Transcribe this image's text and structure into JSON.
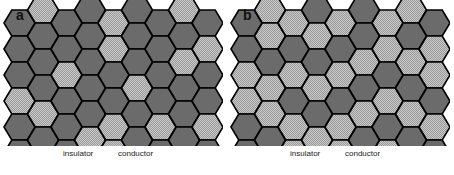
{
  "figure": {
    "width": 454,
    "height": 175,
    "background": "#ffffff",
    "type": "hexagonal-lattice-percolation-diagram"
  },
  "colors": {
    "insulator_fill": "#6b6b6b",
    "conductor_fill": "#9a9a9a",
    "conductor_dither": "#c9c9c9",
    "outline": "#000000",
    "label_text": "#1a1a1a",
    "panel_label_text": "#111111",
    "background": "#ffffff"
  },
  "geometry": {
    "hex_width": 31,
    "hex_height": 26,
    "hex_side": 10.5,
    "col_step": 23.5,
    "row_step": 26,
    "columns": 9,
    "rows": 6,
    "origin_x": 4,
    "origin_y": 10
  },
  "legend": {
    "insulator_label": "insulator",
    "conductor_label": "conductor",
    "insulator_label_x": 63,
    "conductor_label_x": 118,
    "label_y": 150
  },
  "panels": [
    {
      "id": "a",
      "label": "a",
      "label_x": 16,
      "label_y": 8,
      "conductor_fraction": 0.29,
      "grid": [
        [
          0,
          1,
          0,
          0,
          1,
          0,
          0,
          1,
          0
        ],
        [
          0,
          0,
          0,
          0,
          1,
          0,
          0,
          0,
          1
        ],
        [
          0,
          0,
          1,
          0,
          0,
          0,
          0,
          1,
          0
        ],
        [
          1,
          0,
          0,
          0,
          0,
          1,
          0,
          0,
          0
        ],
        [
          0,
          1,
          0,
          0,
          1,
          0,
          1,
          0,
          1
        ],
        [
          0,
          0,
          0,
          1,
          1,
          0,
          0,
          0,
          0
        ]
      ],
      "legend_cells": {
        "insulator_col": 2,
        "insulator_row": 5,
        "conductor_col": 4,
        "conductor_row": 5
      }
    },
    {
      "id": "b",
      "label": "b",
      "label_x": 16,
      "label_y": 8,
      "conductor_fraction": 0.52,
      "grid": [
        [
          0,
          1,
          1,
          0,
          1,
          0,
          1,
          1,
          0
        ],
        [
          0,
          1,
          0,
          1,
          0,
          0,
          1,
          0,
          1
        ],
        [
          1,
          0,
          1,
          0,
          1,
          1,
          0,
          1,
          1
        ],
        [
          1,
          1,
          0,
          1,
          0,
          0,
          1,
          0,
          0
        ],
        [
          0,
          1,
          1,
          0,
          1,
          1,
          0,
          1,
          1
        ],
        [
          0,
          0,
          1,
          1,
          1,
          0,
          1,
          0,
          0
        ]
      ],
      "legend_cells": {
        "insulator_col": 2,
        "insulator_row": 5,
        "conductor_col": 4,
        "conductor_row": 5
      }
    }
  ],
  "chart_data": {
    "type": "heatmap",
    "title": "",
    "categories": [
      "insulator",
      "conductor"
    ],
    "series": [
      {
        "name": "a",
        "conductor_fraction": 0.29,
        "insulator_fraction": 0.71
      },
      {
        "name": "b",
        "conductor_fraction": 0.52,
        "insulator_fraction": 0.48
      }
    ],
    "legend": [
      "insulator",
      "conductor"
    ],
    "xlabel": "",
    "ylabel": "",
    "grid": false
  }
}
